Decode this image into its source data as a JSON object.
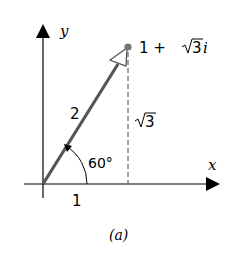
{
  "diagram": {
    "caption": "(a)",
    "axes": {
      "x_label": "x",
      "y_label": "y"
    },
    "point": {
      "label_prefix": "1 + ",
      "label_sqrt": "3",
      "label_suffix": "i",
      "real": 1,
      "imag_label": "√3"
    },
    "vector": {
      "length_label": "2"
    },
    "angle": {
      "label": "60°"
    },
    "segments": {
      "horizontal_label": "1",
      "vertical_label_sqrt": "3"
    },
    "colors": {
      "axis": "#000000",
      "vector": "#555555",
      "point": "#777777",
      "dashed": "#444444"
    }
  }
}
